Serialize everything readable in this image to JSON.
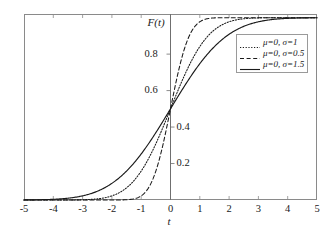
{
  "chart_data": {
    "type": "line",
    "title": "",
    "subtitle": "",
    "xlabel": "t",
    "ylabel": "F(t)",
    "xlim": [
      -5,
      5
    ],
    "ylim": [
      0,
      1.02
    ],
    "grid": false,
    "legend_position": "upper-right-inside",
    "x_ticks": [
      -5,
      -4,
      -3,
      -2,
      -1,
      0,
      1,
      2,
      3,
      4,
      5
    ],
    "x_tick_labels": [
      "-5",
      "-4",
      "-3",
      "-2",
      "-1",
      "0",
      "1",
      "2",
      "3",
      "4",
      "5"
    ],
    "y_ticks": [
      0.2,
      0.4,
      0.6,
      0.8
    ],
    "y_tick_labels": [
      "0.2",
      "0.4",
      "0.6",
      "0.8"
    ],
    "y_tick_label_side": [
      "right",
      "right",
      "left",
      "left"
    ],
    "annotations": [
      {
        "text": "F(t)",
        "role": "y-axis-name"
      },
      {
        "text": "t",
        "role": "x-axis-name"
      }
    ],
    "series": [
      {
        "name": "μ=0, σ=1",
        "mu": 0,
        "sigma": 1,
        "style": "dotted",
        "color": "#1a1a1a",
        "x": [
          -5,
          -4.5,
          -4,
          -3.5,
          -3,
          -2.5,
          -2,
          -1.5,
          -1,
          -0.5,
          0,
          0.5,
          1,
          1.5,
          2,
          2.5,
          3,
          3.5,
          4,
          4.5,
          5
        ],
        "y": [
          0.0,
          0.0,
          0.0,
          0.0,
          0.001,
          0.006,
          0.023,
          0.067,
          0.159,
          0.309,
          0.5,
          0.691,
          0.841,
          0.933,
          0.977,
          0.994,
          0.999,
          1.0,
          1.0,
          1.0,
          1.0
        ]
      },
      {
        "name": "μ=0, σ=0.5",
        "mu": 0,
        "sigma": 0.5,
        "style": "dashed",
        "color": "#1a1a1a",
        "x": [
          -5,
          -4.5,
          -4,
          -3.5,
          -3,
          -2.5,
          -2,
          -1.5,
          -1,
          -0.5,
          0,
          0.5,
          1,
          1.5,
          2,
          2.5,
          3,
          3.5,
          4,
          4.5,
          5
        ],
        "y": [
          0.0,
          0.0,
          0.0,
          0.0,
          0.0,
          0.0,
          0.0,
          0.001,
          0.023,
          0.159,
          0.5,
          0.841,
          0.977,
          0.999,
          1.0,
          1.0,
          1.0,
          1.0,
          1.0,
          1.0,
          1.0
        ]
      },
      {
        "name": "μ=0, σ=1.5",
        "mu": 0,
        "sigma": 1.5,
        "style": "solid",
        "color": "#1a1a1a",
        "x": [
          -5,
          -4.5,
          -4,
          -3.5,
          -3,
          -2.5,
          -2,
          -1.5,
          -1,
          -0.5,
          0,
          0.5,
          1,
          1.5,
          2,
          2.5,
          3,
          3.5,
          4,
          4.5,
          5
        ],
        "y": [
          0.0,
          0.001,
          0.004,
          0.01,
          0.023,
          0.048,
          0.091,
          0.159,
          0.252,
          0.369,
          0.5,
          0.631,
          0.748,
          0.841,
          0.909,
          0.952,
          0.977,
          0.99,
          0.996,
          0.999,
          1.0
        ]
      }
    ]
  },
  "legend": {
    "items": [
      {
        "label": "μ=0, σ=1",
        "style": "dotted"
      },
      {
        "label": "μ=0, σ=0.5",
        "style": "dashed"
      },
      {
        "label": "μ=0, σ=1.5",
        "style": "solid"
      }
    ]
  },
  "axes": {
    "x_name": "t",
    "y_name": "F(t)"
  },
  "colors": {
    "curve": "#1a1a1a",
    "frame": "#8a8a8a",
    "axis": "#6f6f6f",
    "background": "#ffffff"
  }
}
